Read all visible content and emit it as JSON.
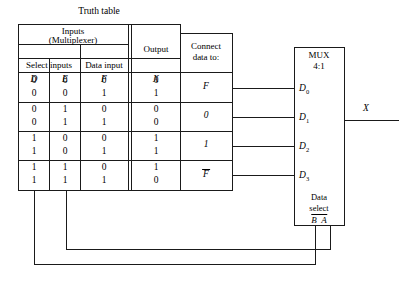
{
  "diagram": {
    "title": "Truth table",
    "type": "multiplexer-implementation-diagram"
  },
  "table": {
    "group_headers": {
      "inputs": "Inputs",
      "inputs_sub": "(Multiplexer)",
      "output": "Output",
      "connect": "Connect",
      "connect_sub": "data to:"
    },
    "sub_headers": {
      "select_inputs": "Select inputs",
      "data_input": "Data input"
    },
    "var_headers": {
      "d": "D",
      "e": "E",
      "f": "F",
      "x": "X"
    },
    "rows": [
      {
        "d": "0",
        "e": "0",
        "f": "0",
        "x": "0"
      },
      {
        "d": "0",
        "e": "0",
        "f": "1",
        "x": "1"
      },
      {
        "d": "0",
        "e": "1",
        "f": "0",
        "x": "0"
      },
      {
        "d": "0",
        "e": "1",
        "f": "1",
        "x": "0"
      },
      {
        "d": "1",
        "e": "0",
        "f": "0",
        "x": "1"
      },
      {
        "d": "1",
        "e": "0",
        "f": "1",
        "x": "1"
      },
      {
        "d": "1",
        "e": "1",
        "f": "0",
        "x": "1"
      },
      {
        "d": "1",
        "e": "1",
        "f": "1",
        "x": "0"
      }
    ],
    "connect_values": [
      "F",
      "0",
      "1",
      "F"
    ],
    "connect_overbar": [
      false,
      false,
      false,
      true
    ]
  },
  "mux": {
    "name": "MUX",
    "ratio": "4:1",
    "data_inputs": [
      "D",
      "D",
      "D",
      "D"
    ],
    "data_input_subscripts": [
      "0",
      "1",
      "2",
      "3"
    ],
    "output_label": "X",
    "select_label_line1": "Data",
    "select_label_line2": "select",
    "select_signals": [
      "B",
      "A"
    ]
  },
  "colors": {
    "line": "#1a1a1a",
    "background": "#ffffff",
    "text": "#000000"
  }
}
